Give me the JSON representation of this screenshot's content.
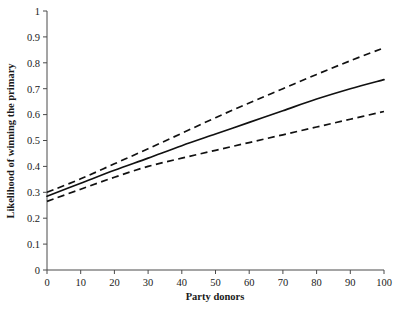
{
  "chart_data": {
    "type": "line",
    "title": "",
    "xlabel": "Party donors",
    "ylabel": "Likelihood of winning the primary",
    "xlim": [
      0,
      100
    ],
    "ylim": [
      0,
      1
    ],
    "grid": false,
    "legend": "none",
    "x": [
      0,
      10,
      20,
      30,
      40,
      50,
      60,
      70,
      80,
      90,
      100
    ],
    "xticks": [
      "0",
      "10",
      "20",
      "30",
      "40",
      "50",
      "60",
      "70",
      "80",
      "90",
      "100"
    ],
    "yticks": [
      "0",
      "0.1",
      "0.2",
      "0.3",
      "0.4",
      "0.5",
      "0.6",
      "0.7",
      "0.8",
      "0.9",
      "1"
    ],
    "series": [
      {
        "name": "Predicted likelihood",
        "style": "solid",
        "values": [
          0.285,
          0.335,
          0.385,
          0.432,
          0.48,
          0.525,
          0.57,
          0.615,
          0.66,
          0.7,
          0.735
        ]
      },
      {
        "name": "Upper 95% confidence bound",
        "style": "dashed",
        "values": [
          0.3,
          0.352,
          0.41,
          0.468,
          0.528,
          0.588,
          0.645,
          0.7,
          0.755,
          0.808,
          0.858
        ]
      },
      {
        "name": "Lower 95% confidence bound",
        "style": "dashed",
        "values": [
          0.265,
          0.312,
          0.358,
          0.4,
          0.432,
          0.462,
          0.492,
          0.522,
          0.552,
          0.582,
          0.612
        ]
      }
    ]
  },
  "axes": {
    "x_label": "Party donors",
    "y_label": "Likelihood of winning the primary"
  }
}
